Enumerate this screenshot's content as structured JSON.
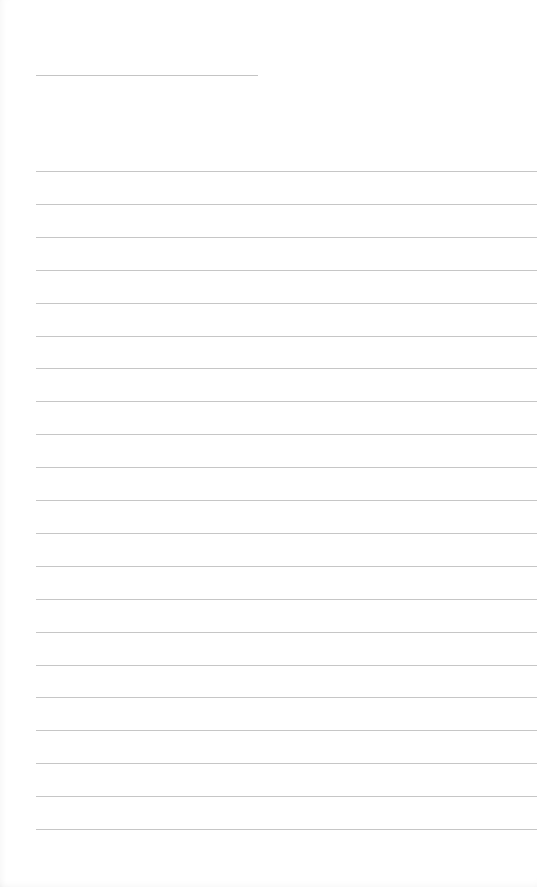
{
  "document": {
    "type": "lined-paper",
    "title_line": {
      "text": ""
    },
    "ruled_lines": [
      {
        "text": ""
      },
      {
        "text": ""
      },
      {
        "text": ""
      },
      {
        "text": ""
      },
      {
        "text": ""
      },
      {
        "text": ""
      },
      {
        "text": ""
      },
      {
        "text": ""
      },
      {
        "text": ""
      },
      {
        "text": ""
      },
      {
        "text": ""
      },
      {
        "text": ""
      },
      {
        "text": ""
      },
      {
        "text": ""
      },
      {
        "text": ""
      },
      {
        "text": ""
      },
      {
        "text": ""
      },
      {
        "text": ""
      },
      {
        "text": ""
      },
      {
        "text": ""
      },
      {
        "text": ""
      }
    ],
    "colors": {
      "paper": "#ffffff",
      "rule": "#c6c6c6"
    }
  }
}
